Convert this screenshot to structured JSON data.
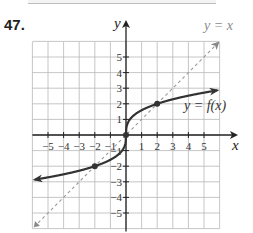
{
  "problem": {
    "number": "47."
  },
  "chart_data": {
    "type": "line",
    "title": "",
    "xlabel": "x",
    "ylabel": "y",
    "xlim": [
      -6,
      6
    ],
    "ylim": [
      -6,
      6
    ],
    "grid": true,
    "x_ticks": [
      "-5",
      "-4",
      "-3",
      "-2",
      "-1",
      "1",
      "2",
      "3",
      "4",
      "5"
    ],
    "y_ticks": [
      "5",
      "4",
      "3",
      "2",
      "1",
      "-1",
      "-2",
      "-3",
      "-4",
      "-5"
    ],
    "series": [
      {
        "name": "y = f(x)",
        "style": "solid",
        "color": "#333333",
        "function_hint": "cube-root shaped, f(x) = ∛(4x)",
        "points": [
          [
            -5.8,
            -2.85
          ],
          [
            -4,
            -2.52
          ],
          [
            -2,
            -2
          ],
          [
            -1,
            -1.59
          ],
          [
            -0.25,
            -1
          ],
          [
            0,
            0
          ],
          [
            0.25,
            1
          ],
          [
            1,
            1.59
          ],
          [
            2,
            2
          ],
          [
            4,
            2.52
          ],
          [
            5.8,
            2.85
          ]
        ],
        "marked_points": [
          [
            -2,
            -2
          ],
          [
            0,
            0
          ],
          [
            2,
            2
          ]
        ]
      },
      {
        "name": "y = x",
        "style": "dashed",
        "color": "#999999",
        "points": [
          [
            -6,
            -6
          ],
          [
            6,
            6
          ]
        ]
      }
    ],
    "annotations": [
      "y = x",
      "y = f(x)"
    ]
  },
  "labels": {
    "x_axis": "x",
    "y_axis": "y",
    "identity_line": "y = x",
    "function_line": "y = f(x)"
  }
}
